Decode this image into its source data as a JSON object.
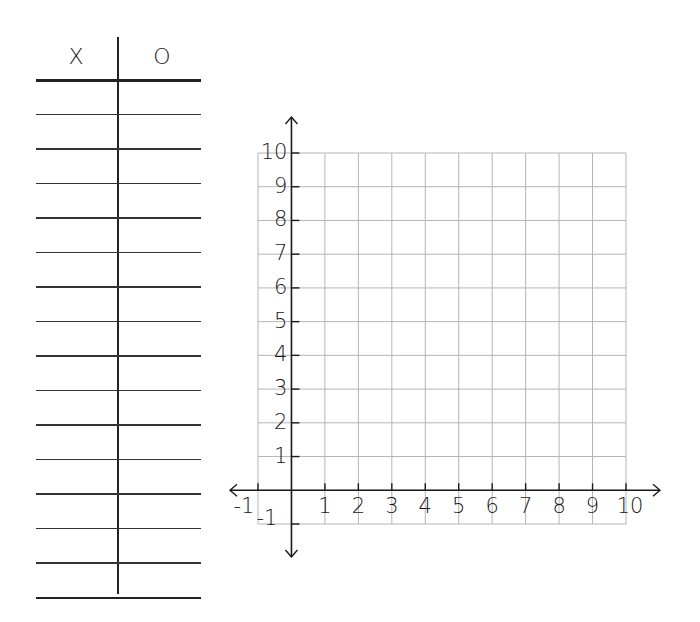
{
  "tchart": {
    "headers": [
      "X",
      "O"
    ],
    "rows": [
      {
        "x": "",
        "o": ""
      },
      {
        "x": "",
        "o": ""
      },
      {
        "x": "",
        "o": ""
      },
      {
        "x": "",
        "o": ""
      },
      {
        "x": "",
        "o": ""
      },
      {
        "x": "",
        "o": ""
      },
      {
        "x": "",
        "o": ""
      },
      {
        "x": "",
        "o": ""
      },
      {
        "x": "",
        "o": ""
      },
      {
        "x": "",
        "o": ""
      },
      {
        "x": "",
        "o": ""
      },
      {
        "x": "",
        "o": ""
      },
      {
        "x": "",
        "o": ""
      },
      {
        "x": "",
        "o": ""
      },
      {
        "x": "",
        "o": ""
      }
    ]
  },
  "graph": {
    "x_labels": [
      "-1",
      "1",
      "2",
      "3",
      "4",
      "5",
      "6",
      "7",
      "8",
      "9",
      "10"
    ],
    "y_labels": [
      "10",
      "9",
      "8",
      "7",
      "6",
      "5",
      "4",
      "3",
      "2",
      "1",
      "-1"
    ],
    "x_range": [
      -1,
      10
    ],
    "y_range": [
      -1,
      10
    ],
    "grid": true,
    "colors": {
      "grid": "#b5b5b5",
      "axis": "#1a1a1a"
    }
  }
}
